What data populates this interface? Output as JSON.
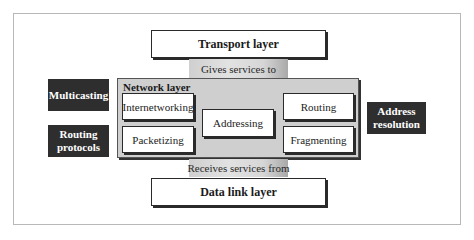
{
  "diagram": {
    "upper_layer": {
      "label": "Transport layer"
    },
    "upper_connector": {
      "label": "Gives services to"
    },
    "network_layer": {
      "title": "Network layer",
      "functions": [
        {
          "label": "Internetworking"
        },
        {
          "label": "Packetizing"
        },
        {
          "label": "Addressing"
        },
        {
          "label": "Routing"
        },
        {
          "label": "Fragmenting"
        }
      ]
    },
    "lower_connector": {
      "label": "Receives services from"
    },
    "lower_layer": {
      "label": "Data link layer"
    },
    "auxiliary_protocols": [
      {
        "label": "Multicasting"
      },
      {
        "label": "Routing protocols"
      },
      {
        "label": "Address resolution"
      }
    ]
  },
  "colors": {
    "dark_box": "#2e2e2e",
    "network_fill": "#cfcfcf",
    "box_border": "#2a2a2a",
    "frame_border": "#b8b8b8"
  }
}
